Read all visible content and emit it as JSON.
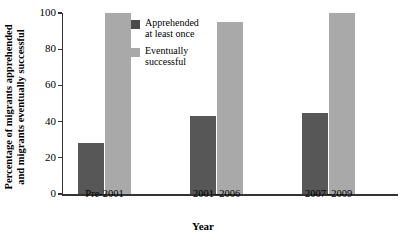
{
  "chart_data": {
    "type": "bar",
    "title": "",
    "subtitle": "",
    "xlabel": "Year",
    "ylabel": "Percentage of migrants apprehended\nand migrants eventually successful",
    "categories": [
      "Pre-2001",
      "2001–2006",
      "2007–2009"
    ],
    "series": [
      {
        "name": "Apprehended\nat least once",
        "legend_label": "Apprehended\nat least once",
        "color": "#575757",
        "values": [
          28,
          43,
          45
        ]
      },
      {
        "name": "Eventually\nsuccessful",
        "legend_label": "Eventually\nsuccessful",
        "color": "#a9a9a9",
        "values": [
          100,
          95,
          100
        ]
      }
    ],
    "ylim": [
      0,
      100
    ],
    "yticks": [
      0,
      20,
      40,
      60,
      80,
      100
    ],
    "ytick_labels": [
      "0",
      "20",
      "40",
      "60",
      "80",
      "100"
    ],
    "grid": false,
    "legend_position": "inside-upper-left-center",
    "background_color": "#ffffff",
    "axis_color": "#333333"
  }
}
